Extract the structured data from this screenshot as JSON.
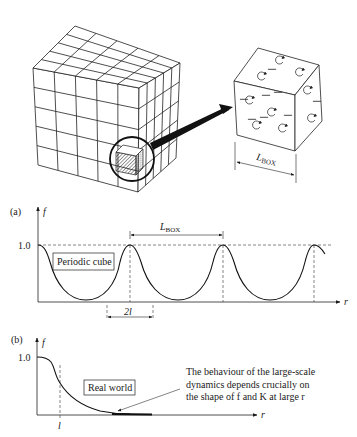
{
  "figure": {
    "top": {
      "large_cube": {
        "grid": [
          5,
          5,
          5
        ],
        "description": "5x5x5 lattice of periodic boxes"
      },
      "highlight": {
        "description": "circled hatched sub-box"
      },
      "small_cube": {
        "dimension_label": "L",
        "dimension_subscript": "BOX"
      }
    },
    "panel_a": {
      "tag": "(a)",
      "y_axis_label": "f",
      "x_axis_label": "r",
      "y_tick": "1.0",
      "box_label": "Periodic cube",
      "period_label": "L",
      "period_subscript": "BOX",
      "width_label": "2l"
    },
    "panel_b": {
      "tag": "(b)",
      "y_axis_label": "f",
      "x_axis_label": "r",
      "y_tick": "1.0",
      "box_label": "Real world",
      "x_marker": "l",
      "annotation_lines": [
        "The behaviour of the large-scale",
        "dynamics depends crucially on",
        "the shape of f and K at large r"
      ]
    }
  },
  "chart_data": [
    {
      "type": "line",
      "title": "(a) Periodic cube",
      "xlabel": "r",
      "ylabel": "f",
      "y_ticks": [
        "1.0"
      ],
      "ylim": [
        0,
        1.0
      ],
      "annotations": [
        "Periodic cube",
        "L_BOX (peak-to-peak period)",
        "2l (peak width)"
      ],
      "series": [
        {
          "name": "f(r) periodic",
          "x": [
            0,
            0.5,
            1.0,
            1.5,
            2.0,
            2.5,
            3.0,
            3.3
          ],
          "values": [
            1.0,
            0.02,
            1.0,
            0.02,
            1.0,
            0.02,
            1.0,
            0.85
          ]
        }
      ],
      "x_unit": "L_BOX",
      "grid": false
    },
    {
      "type": "line",
      "title": "(b) Real world",
      "xlabel": "r",
      "ylabel": "f",
      "y_ticks": [
        "1.0"
      ],
      "x_ticks": [
        "l"
      ],
      "ylim": [
        0,
        1.0
      ],
      "annotations": [
        "Real world",
        "The behaviour of the large-scale dynamics depends crucially on the shape of f and K at large r"
      ],
      "series": [
        {
          "name": "f(r) real world",
          "x": [
            0,
            0.5,
            1.0,
            1.5,
            2.0,
            3.0,
            4.0
          ],
          "values": [
            1.0,
            0.95,
            0.55,
            0.3,
            0.15,
            0.03,
            0.0
          ]
        }
      ],
      "x_unit": "l",
      "grid": false
    }
  ]
}
